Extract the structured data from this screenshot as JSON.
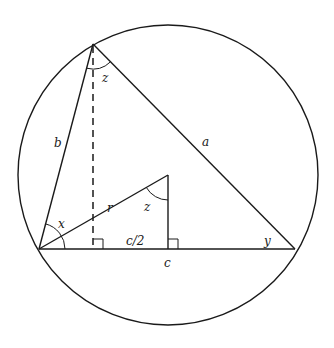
{
  "diagram": {
    "colors": {
      "stroke": "#1a1a1a",
      "background": "#ffffff"
    },
    "circle": {
      "cx": 168,
      "cy": 175,
      "r": 150
    },
    "vertices": {
      "A": {
        "x": 39,
        "y": 249
      },
      "B": {
        "x": 93,
        "y": 44
      },
      "C": {
        "x": 295,
        "y": 249
      },
      "O": {
        "x": 168,
        "y": 175
      }
    },
    "labels": {
      "side_a": "a",
      "side_b": "b",
      "side_c": "c",
      "half_c": "c/2",
      "radius": "r",
      "angle_x": "x",
      "angle_y": "y",
      "angle_z_top": "z",
      "angle_z_center": "z"
    },
    "right_angle_markers": [
      {
        "at": "altitude-foot",
        "x": 93,
        "y": 249
      },
      {
        "at": "midpoint-of-c",
        "x": 168,
        "y": 249
      }
    ]
  }
}
